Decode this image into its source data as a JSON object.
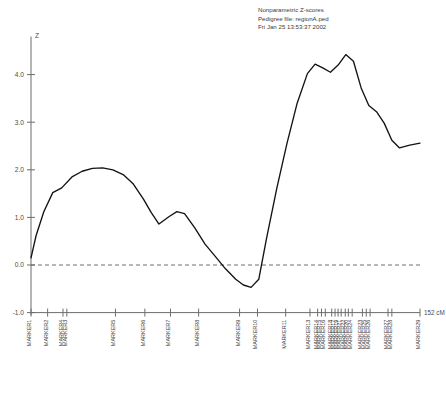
{
  "header": {
    "line1": "Nonparametric Z-scores",
    "line2": "Pedigree file: regionA.ped",
    "line3": "Fri Jan 25 13:53:37 2002"
  },
  "axes": {
    "y_title": "Z",
    "x_end_label": "152 cM",
    "y_ticks": [
      "4.0",
      "3.0",
      "2.0",
      "1.0",
      "0.0",
      "-1.0"
    ]
  },
  "colors": {
    "curve": "#131313",
    "axis": "#6d6d6d",
    "zero_line": "#5d5d5d",
    "text": "#3d3d3d"
  },
  "chart_data": {
    "type": "line",
    "title": "Nonparametric Z-scores",
    "subtitle": "Pedigree file: regionA.ped",
    "timestamp": "Fri Jan 25 13:53:37 2002",
    "xlabel": "152 cM",
    "ylabel": "Z",
    "ylim": [
      -1.0,
      4.8
    ],
    "xlim": [
      0,
      152
    ],
    "yticks": [
      -1.0,
      0.0,
      1.0,
      2.0,
      3.0,
      4.0
    ],
    "grid": false,
    "legend": "none",
    "zero_reference_line": 0.0,
    "markers": [
      {
        "label": "MARKER1",
        "cM": 0.0
      },
      {
        "label": "MARKER2",
        "cM": 6.5
      },
      {
        "label": "MARKER4",
        "cM": 12.5
      },
      {
        "label": "MARKER3",
        "cM": 14.0
      },
      {
        "label": "MARKER5",
        "cM": 33.0
      },
      {
        "label": "MARKER6",
        "cM": 44.5
      },
      {
        "label": "MARKER7",
        "cM": 54.5
      },
      {
        "label": "MARKER8",
        "cM": 65.5
      },
      {
        "label": "MARKER9",
        "cM": 81.5
      },
      {
        "label": "MARKER10",
        "cM": 88.5
      },
      {
        "label": "MARKER11",
        "cM": 99.5
      },
      {
        "label": "MARKER13",
        "cM": 109.0
      },
      {
        "label": "MARKER14",
        "cM": 112.0
      },
      {
        "label": "MARKER15",
        "cM": 113.5
      },
      {
        "label": "MARKER16",
        "cM": 115.0
      },
      {
        "label": "MARKER18",
        "cM": 117.5
      },
      {
        "label": "MARKER17",
        "cM": 118.8
      },
      {
        "label": "MARKER19",
        "cM": 120.0
      },
      {
        "label": "MARKER21",
        "cM": 121.2
      },
      {
        "label": "MARKER22",
        "cM": 122.8
      },
      {
        "label": "MARKER20",
        "cM": 124.0
      },
      {
        "label": "MARKER24",
        "cM": 125.5
      },
      {
        "label": "MARKER23",
        "cM": 129.5
      },
      {
        "label": "MARKER25",
        "cM": 131.0
      },
      {
        "label": "MARKER26",
        "cM": 132.5
      },
      {
        "label": "MARKER27",
        "cM": 139.5
      },
      {
        "label": "MARKER28",
        "cM": 141.0
      },
      {
        "label": "MARKER29",
        "cM": 152.0
      }
    ],
    "x": [
      0.0,
      2.0,
      5.0,
      8.5,
      12.0,
      16.0,
      20.0,
      24.0,
      28.0,
      32.0,
      36.0,
      40.0,
      44.0,
      47.0,
      50.0,
      54.0,
      57.0,
      60.0,
      64.0,
      68.0,
      72.0,
      76.0,
      80.0,
      83.0,
      86.0,
      89.0,
      92.0,
      96.0,
      100.0,
      104.0,
      108.0,
      111.0,
      114.0,
      117.0,
      120.0,
      123.0,
      126.0,
      129.0,
      132.0,
      135.0,
      138.0,
      141.0,
      144.0,
      148.0,
      152.0
    ],
    "y": [
      0.15,
      0.62,
      1.12,
      1.52,
      1.62,
      1.85,
      1.97,
      2.03,
      2.04,
      2.0,
      1.9,
      1.7,
      1.38,
      1.1,
      0.86,
      1.02,
      1.12,
      1.08,
      0.78,
      0.44,
      0.18,
      -0.08,
      -0.3,
      -0.42,
      -0.47,
      -0.3,
      0.55,
      1.6,
      2.55,
      3.4,
      4.02,
      4.22,
      4.14,
      4.05,
      4.2,
      4.42,
      4.28,
      3.72,
      3.35,
      3.22,
      2.98,
      2.62,
      2.46,
      2.52,
      2.56
    ]
  }
}
